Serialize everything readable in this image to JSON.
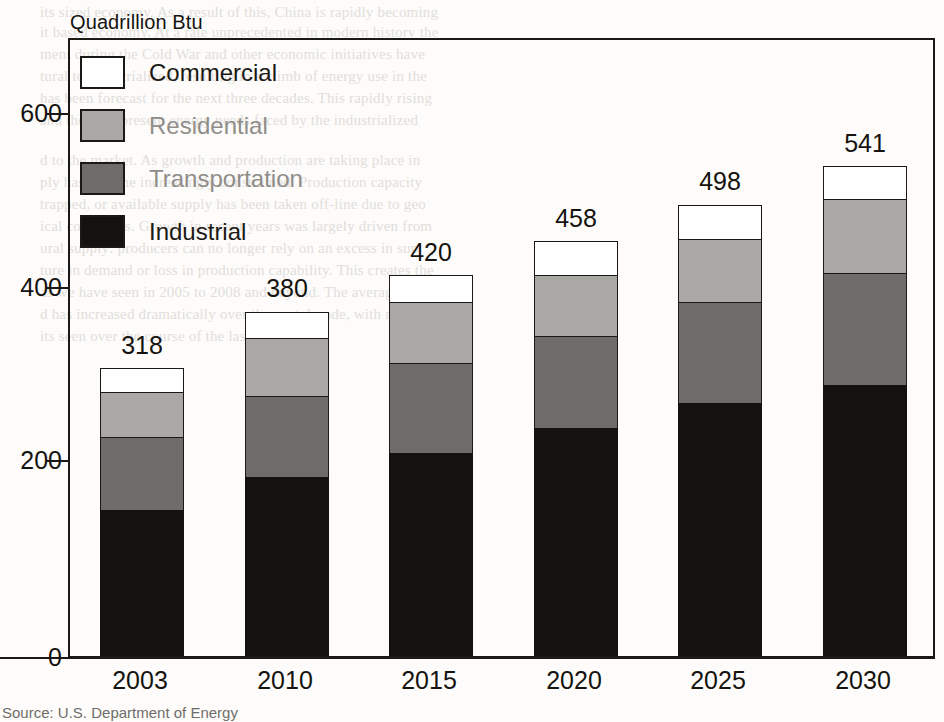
{
  "figure": {
    "axis_title": "Quadrillion Btu",
    "source": "Source: U.S. Department of Energy"
  },
  "legend": {
    "items": [
      {
        "label": "Commercial",
        "color": "#ffffff",
        "key": "commercial"
      },
      {
        "label": "Residential",
        "color": "#a9a8a5",
        "key": "residential"
      },
      {
        "label": "Transportation",
        "color": "#6d6c69",
        "key": "transportation"
      },
      {
        "label": "Industrial",
        "color": "#141210",
        "key": "industrial"
      }
    ]
  },
  "axis": {
    "y_ticks": [
      "600",
      "400",
      "200",
      "0"
    ],
    "x_ticks": [
      "2003",
      "2010",
      "2015",
      "2020",
      "2025",
      "2030"
    ]
  },
  "totals": [
    "318",
    "380",
    "420",
    "458",
    "498",
    "541"
  ],
  "chart_data": {
    "type": "bar",
    "subtype": "stacked-vertical",
    "title": "",
    "xlabel": "",
    "ylabel": "Quadrillion Btu",
    "ylim": [
      0,
      600
    ],
    "yticks": [
      0,
      200,
      400,
      600
    ],
    "grid": false,
    "legend_position": "inside-top-left",
    "categories": [
      "2003",
      "2010",
      "2015",
      "2020",
      "2025",
      "2030"
    ],
    "series": [
      {
        "name": "Industrial",
        "color": "#141210",
        "values": [
          161,
          197,
          224,
          252,
          279,
          299
        ]
      },
      {
        "name": "Transportation",
        "color": "#6d6c69",
        "values": [
          81,
          90,
          99,
          101,
          112,
          123
        ]
      },
      {
        "name": "Residential",
        "color": "#a9a8a5",
        "values": [
          49,
          64,
          68,
          67,
          69,
          82
        ]
      },
      {
        "name": "Commercial",
        "color": "#ffffff",
        "values": [
          27,
          29,
          29,
          38,
          38,
          37
        ]
      }
    ],
    "totals": [
      318,
      380,
      420,
      458,
      498,
      541
    ],
    "data_labels": [
      "318",
      "380",
      "420",
      "458",
      "498",
      "541"
    ],
    "annotations": [
      "Source: U.S. Department of Energy"
    ]
  },
  "bleed_text": [
    {
      "x": 40,
      "y": 4,
      "t": "its sized economy. As a result of this, China is rapidly becoming"
    },
    {
      "x": 40,
      "y": 24,
      "t": "it based economy. At a rate unprecedented in modern history the"
    },
    {
      "x": 40,
      "y": 46,
      "t": "ment during the Cold War and other economic initiatives have"
    },
    {
      "x": 40,
      "y": 68,
      "t": "tural to industrialized, resulting in a climb of energy use in the"
    },
    {
      "x": 40,
      "y": 90,
      "t": "has been forecast for the next three decades. This rapidly rising"
    },
    {
      "x": 40,
      "y": 112,
      "t": "and the ever-present energy needs faced by the industrialized"
    },
    {
      "x": 40,
      "y": 152,
      "t": "d to the market. As growth and production are taking place in"
    },
    {
      "x": 40,
      "y": 174,
      "t": "ply has become increasingly constrained. Production capacity"
    },
    {
      "x": 40,
      "y": 196,
      "t": "trapped, or available supply has been taken off-line due to geo"
    },
    {
      "x": 40,
      "y": 218,
      "t": "ical conditions. Growth in recent years was largely driven from"
    },
    {
      "x": 40,
      "y": 240,
      "t": "ural supply: producers can no longer rely on an excess in sup"
    },
    {
      "x": 40,
      "y": 262,
      "t": "ture in demand or loss in production capability. This creates the"
    },
    {
      "x": 40,
      "y": 284,
      "t": "as we have seen in 2005 to 2008 and beyond. The average price"
    },
    {
      "x": 40,
      "y": 306,
      "t": "d has increased dramatically over the past decade, with notable"
    },
    {
      "x": 40,
      "y": 328,
      "t": "its seen over the course of the last few years."
    }
  ]
}
